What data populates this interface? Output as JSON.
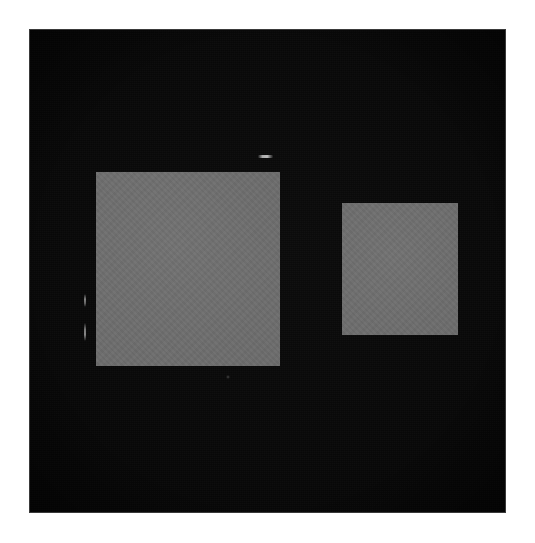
{
  "image": {
    "kind": "photograph",
    "width": 535,
    "height": 543,
    "page_background_color": "#ffffff",
    "description": "Two flat gray rectangular patches on a black background"
  },
  "backdrop": {
    "name": "black-background-plate",
    "color": "#000000",
    "x": 30,
    "y": 30,
    "width": 475,
    "height": 482
  },
  "shapes": [
    {
      "id": "large-square",
      "label": "large gray square",
      "color": "#6d6d6d",
      "x": 96,
      "y": 172,
      "width": 184,
      "height": 194
    },
    {
      "id": "small-square",
      "label": "small gray square",
      "color": "#6d6d6d",
      "x": 342,
      "y": 203,
      "width": 116,
      "height": 132
    }
  ],
  "artifacts": [
    {
      "id": "streak-top",
      "label": "light horizontal streak above large square",
      "color": "#d7d7d7",
      "x": 258,
      "y": 155,
      "width": 15,
      "height": 3
    },
    {
      "id": "streak-left-upper",
      "label": "faint vertical streak left of large square",
      "color": "#cdcdcd",
      "x": 84,
      "y": 294,
      "width": 2,
      "height": 13
    },
    {
      "id": "streak-left-lower",
      "label": "faint vertical streak left of large square",
      "color": "#cdcdcd",
      "x": 84,
      "y": 323,
      "width": 2,
      "height": 18
    },
    {
      "id": "speck-bottom",
      "label": "tiny dim speck below large square",
      "color": "#787878",
      "x": 226,
      "y": 375,
      "width": 4,
      "height": 4
    }
  ],
  "caption": "Two flat gray squares of unequal size photographed against a black background."
}
